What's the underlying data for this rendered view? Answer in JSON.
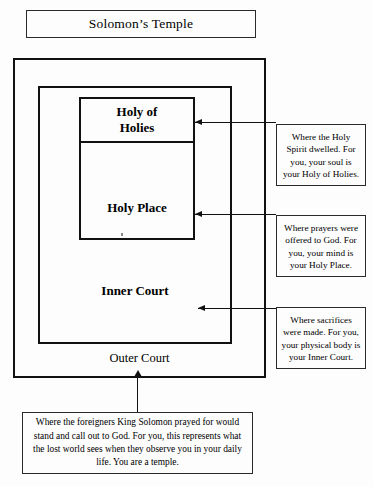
{
  "diagram": {
    "title": "Solomon’s Temple",
    "zones": [
      {
        "key": "holy_of_holies",
        "label": "Holy of\nHolies"
      },
      {
        "key": "holy_place",
        "label": "Holy Place"
      },
      {
        "key": "inner_court",
        "label": "Inner Court"
      },
      {
        "key": "outer_court",
        "label": "Outer Court"
      }
    ],
    "labels": {
      "holy_of_holies": "Holy of Holies",
      "holy_of_holies_line1": "Holy of",
      "holy_of_holies_line2": "Holies",
      "holy_place": "Holy Place",
      "inner_court": "Inner Court",
      "outer_court": "Outer Court"
    },
    "notes": {
      "holy_of_holies": "Where the Holy Spirit dwelled. For you, your soul is your Holy of Holies.",
      "holy_place": "Where prayers were offered to God. For you, your mind is your Holy Place.",
      "inner_court": "Where sacrifices were made. For you, your physical body is your Inner Court.",
      "outer_court": "Where the foreigners King Solomon prayed for would stand and call out to God. For you, this represents what the lost world sees when they observe you in your daily life. You are a temple."
    },
    "colors": {
      "background": "#fdfdfd",
      "stroke": "#111111",
      "thin_stroke": "#2a2a2a",
      "text": "#000000"
    }
  }
}
